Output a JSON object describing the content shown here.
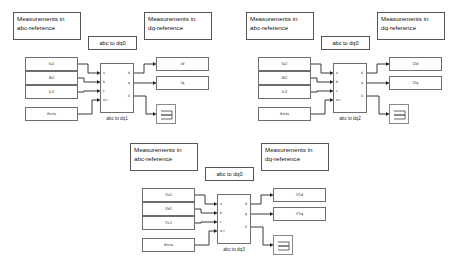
{
  "page": {
    "background_color": "#ffffff",
    "line_color": "#222222",
    "box_border_color": "#6e6e6e",
    "width": 466,
    "height": 273
  },
  "diagrams": [
    {
      "id": "diagram-1",
      "note_left": "Measurements in\nabc-reference",
      "note_right": "Measurements in\ndq-reference",
      "block_label": "abc to dq0",
      "block_caption": "abc to dq1",
      "inputs": [
        {
          "label": "Ia1"
        },
        {
          "label": "Ib1"
        },
        {
          "label": "Ic1"
        },
        {
          "label": "theta"
        }
      ],
      "input_ports": [
        "a",
        "b",
        "c",
        "w t"
      ],
      "output_ports": [
        "d",
        "q",
        "0"
      ],
      "outputs": [
        {
          "label": "Id"
        },
        {
          "label": "Iq"
        }
      ],
      "scope": "scope-icon"
    },
    {
      "id": "diagram-2",
      "note_left": "Measurements in\nabc-reference",
      "note_right": "Measurements in\ndq-reference",
      "block_label": "abc to dq0",
      "block_caption": "abc to dq2",
      "inputs": [
        {
          "label": "Ia2"
        },
        {
          "label": "Ib2"
        },
        {
          "label": "Ic2"
        },
        {
          "label": "theta"
        }
      ],
      "input_ports": [
        "a",
        "b",
        "c",
        "w t"
      ],
      "output_ports": [
        "d",
        "q",
        "0"
      ],
      "outputs": [
        {
          "label": "I2d"
        },
        {
          "label": "I2q"
        }
      ],
      "scope": "scope-icon"
    },
    {
      "id": "diagram-3",
      "note_left": "Measurements in\nabc-reference",
      "note_right": "Measurements in\ndq-reference",
      "block_label": "abc to dq0",
      "block_caption": "abc to dq3",
      "inputs": [
        {
          "label": "Va1"
        },
        {
          "label": "Vb1"
        },
        {
          "label": "Vc1"
        },
        {
          "label": "theta"
        }
      ],
      "input_ports": [
        "a",
        "b",
        "c",
        "w t"
      ],
      "output_ports": [
        "d",
        "q",
        "0"
      ],
      "outputs": [
        {
          "label": "V1d"
        },
        {
          "label": "V1q"
        }
      ],
      "scope": "scope-icon"
    }
  ]
}
